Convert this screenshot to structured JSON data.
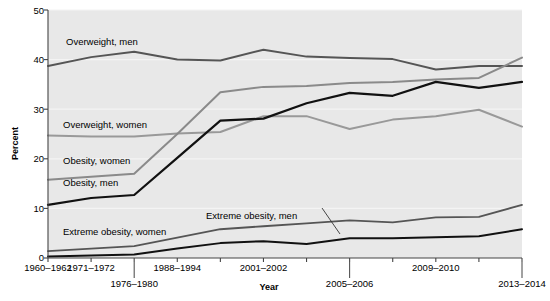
{
  "chart_data": {
    "type": "line",
    "title": "",
    "xlabel": "Year",
    "ylabel": "Percent",
    "ylim": [
      0,
      50
    ],
    "yticks": [
      0,
      10,
      20,
      30,
      40,
      50
    ],
    "grid": true,
    "legend_position": "inline-labels",
    "x": [
      "1960-1962",
      "1971-1974",
      "1976-1980",
      "1988-1994",
      "1999-2000",
      "2001-2002",
      "2003-2004",
      "2005-2006",
      "2007-2008",
      "2009-2010",
      "2011-2012",
      "2013-2014"
    ],
    "xtick_labels_shown": [
      {
        "label": "1960–1962",
        "index": 0,
        "row": 0
      },
      {
        "label": "1971–1972",
        "index": 1,
        "row": 0
      },
      {
        "label": "1976–1980",
        "index": 2,
        "row": 1
      },
      {
        "label": "1988–1994",
        "index": 3,
        "row": 0
      },
      {
        "label": "2001–2002",
        "index": 5,
        "row": 0
      },
      {
        "label": "2005–2006",
        "index": 7,
        "row": 1
      },
      {
        "label": "2009–2010",
        "index": 9,
        "row": 0
      },
      {
        "label": "2013–2014",
        "index": 11,
        "row": 1
      }
    ],
    "series": [
      {
        "name": "Overweight, men",
        "color": "#555555",
        "width": 2.0,
        "values": [
          38.7,
          40.5,
          41.6,
          40.0,
          39.8,
          42.0,
          40.6,
          40.3,
          40.1,
          38.0,
          38.7,
          38.7
        ]
      },
      {
        "name": "Overweight, women",
        "color": "#999999",
        "width": 2.0,
        "values": [
          24.7,
          24.5,
          24.5,
          25.1,
          25.4,
          28.6,
          28.6,
          26.0,
          27.9,
          28.6,
          29.9,
          26.5
        ]
      },
      {
        "name": "Obesity, women",
        "color": "#8a8a8a",
        "width": 2.0,
        "values": [
          15.8,
          16.4,
          17.0,
          25.0,
          33.4,
          34.5,
          34.7,
          35.3,
          35.5,
          36.0,
          36.3,
          40.4
        ]
      },
      {
        "name": "Obesity, men",
        "color": "#111111",
        "width": 2.2,
        "values": [
          10.7,
          12.1,
          12.7,
          20.2,
          27.7,
          28.1,
          31.2,
          33.3,
          32.7,
          35.5,
          34.3,
          35.5
        ]
      },
      {
        "name": "Extreme obesity, women",
        "color": "#555555",
        "width": 1.8,
        "values": [
          1.4,
          1.9,
          2.4,
          4.1,
          5.8,
          6.4,
          7.0,
          7.6,
          7.2,
          8.2,
          8.3,
          10.7
        ]
      },
      {
        "name": "Extreme obesity, men",
        "color": "#111111",
        "width": 2.0,
        "values": [
          0.3,
          0.5,
          0.7,
          1.9,
          3.0,
          3.4,
          2.8,
          4.0,
          4.0,
          4.2,
          4.4,
          5.8
        ]
      }
    ],
    "annotations": [
      {
        "text": "Overweight, men",
        "x_px": 66,
        "y_px": 36
      },
      {
        "text": "Overweight, women",
        "x_px": 63,
        "y_px": 119
      },
      {
        "text": "Obesity, women",
        "x_px": 63,
        "y_px": 155
      },
      {
        "text": "Obesity, men",
        "x_px": 63,
        "y_px": 177
      },
      {
        "text": "Extreme obesity, women",
        "x_px": 63,
        "y_px": 226
      },
      {
        "text": "Extreme obesity, men",
        "x_px": 206,
        "y_px": 210
      }
    ]
  },
  "axis": {
    "y_title": "Percent",
    "x_title": "Year",
    "y_tick_0": "0",
    "y_tick_10": "10",
    "y_tick_20": "20",
    "y_tick_30": "30",
    "y_tick_40": "40",
    "y_tick_50": "50"
  },
  "colors": {
    "plot_background": "#e8e8e8",
    "page_background": "#ffffff",
    "axis": "#444444",
    "gridline": "#f4f4f4",
    "text": "#000000"
  }
}
